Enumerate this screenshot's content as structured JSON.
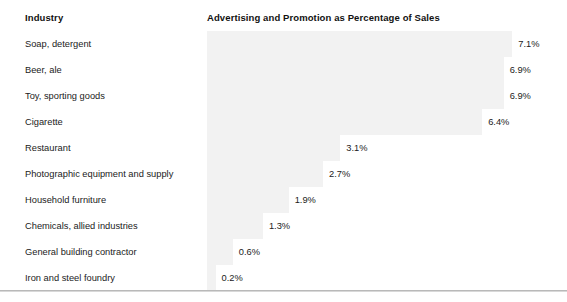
{
  "headers": {
    "industry": "Industry",
    "metric": "Advertising and Promotion as Percentage of Sales"
  },
  "chart_data": {
    "type": "bar",
    "orientation": "horizontal",
    "title": "Advertising and Promotion as Percentage of Sales",
    "xlabel": "",
    "ylabel": "Industry",
    "grid": false,
    "legend": null,
    "value_suffix": "%",
    "xlim": [
      0,
      7.1
    ],
    "bar_color": "#f2f2f2",
    "categories": [
      "Soap, detergent",
      "Beer, ale",
      "Toy, sporting goods",
      "Cigarette",
      "Restaurant",
      "Photographic equipment and supply",
      "Household furniture",
      "Chemicals, allied industries",
      "General building contractor",
      "Iron and steel foundry"
    ],
    "values": [
      7.1,
      6.9,
      6.9,
      6.4,
      3.1,
      2.7,
      1.9,
      1.3,
      0.6,
      0.2
    ],
    "value_labels": [
      "7.1%",
      "6.9%",
      "6.9%",
      "6.4%",
      "3.1%",
      "2.7%",
      "1.9%",
      "1.3%",
      "0.6%",
      "0.2%"
    ]
  },
  "rows": [
    {
      "label": "Soap, detergent",
      "value": 7.1,
      "value_label": "7.1%"
    },
    {
      "label": "Beer, ale",
      "value": 6.9,
      "value_label": "6.9%"
    },
    {
      "label": "Toy, sporting goods",
      "value": 6.9,
      "value_label": "6.9%"
    },
    {
      "label": "Cigarette",
      "value": 6.4,
      "value_label": "6.4%"
    },
    {
      "label": "Restaurant",
      "value": 3.1,
      "value_label": "3.1%"
    },
    {
      "label": "Photographic equipment and supply",
      "value": 2.7,
      "value_label": "2.7%"
    },
    {
      "label": "Household furniture",
      "value": 1.9,
      "value_label": "1.9%"
    },
    {
      "label": "Chemicals, allied industries",
      "value": 1.3,
      "value_label": "1.3%"
    },
    {
      "label": "General building contractor",
      "value": 0.6,
      "value_label": "0.6%"
    },
    {
      "label": "Iron and steel foundry",
      "value": 0.2,
      "value_label": "0.2%"
    }
  ],
  "layout": {
    "row_start_y": 31,
    "row_height": 26,
    "bar_scale_px_per_unit": 43,
    "bar_track_width": 335
  }
}
